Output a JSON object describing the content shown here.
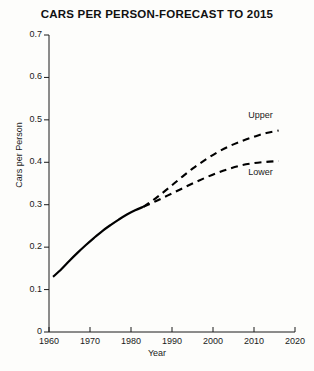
{
  "chart_data": {
    "type": "line",
    "title": "CARS PER PERSON-FORECAST TO 2015",
    "xlabel": "Year",
    "ylabel": "Cars per Person",
    "xlim": [
      1960,
      2020
    ],
    "ylim": [
      0,
      0.7
    ],
    "grid": false,
    "legend_position": "inline-right-end-labels",
    "x_ticks": [
      "1960",
      "1970",
      "1980",
      "1990",
      "2000",
      "2010",
      "2020"
    ],
    "x_tick_values": [
      1960,
      1970,
      1980,
      1990,
      2000,
      2010,
      2020
    ],
    "y_ticks": [
      "0",
      "0.1",
      "0.2",
      "0.3",
      "0.4",
      "0.5",
      "0.6",
      "0.7"
    ],
    "y_tick_values": [
      0,
      0.1,
      0.2,
      0.3,
      0.4,
      0.5,
      0.6,
      0.7
    ],
    "series": [
      {
        "name": "Historical",
        "style": "solid",
        "color": "#000000",
        "x": [
          1961,
          1963,
          1965,
          1967,
          1969,
          1971,
          1973,
          1975,
          1977,
          1979,
          1981,
          1983
        ],
        "values": [
          0.13,
          0.148,
          0.168,
          0.187,
          0.205,
          0.222,
          0.238,
          0.252,
          0.265,
          0.277,
          0.287,
          0.295
        ]
      },
      {
        "name": "Upper",
        "style": "dashed",
        "color": "#000000",
        "x": [
          1983,
          1986,
          1989,
          1992,
          1995,
          1998,
          2001,
          2004,
          2007,
          2010,
          2013,
          2016
        ],
        "values": [
          0.295,
          0.315,
          0.338,
          0.362,
          0.385,
          0.405,
          0.423,
          0.438,
          0.45,
          0.46,
          0.469,
          0.475
        ]
      },
      {
        "name": "Lower",
        "style": "dashed",
        "color": "#000000",
        "x": [
          1983,
          1986,
          1989,
          1992,
          1995,
          1998,
          2001,
          2004,
          2007,
          2010,
          2013,
          2016
        ],
        "values": [
          0.295,
          0.308,
          0.322,
          0.336,
          0.35,
          0.363,
          0.375,
          0.385,
          0.393,
          0.398,
          0.401,
          0.403
        ]
      }
    ],
    "annotations": [
      {
        "text": "Upper",
        "x": 2012,
        "y": 0.508
      },
      {
        "text": "Lower",
        "x": 2012,
        "y": 0.375
      }
    ]
  }
}
